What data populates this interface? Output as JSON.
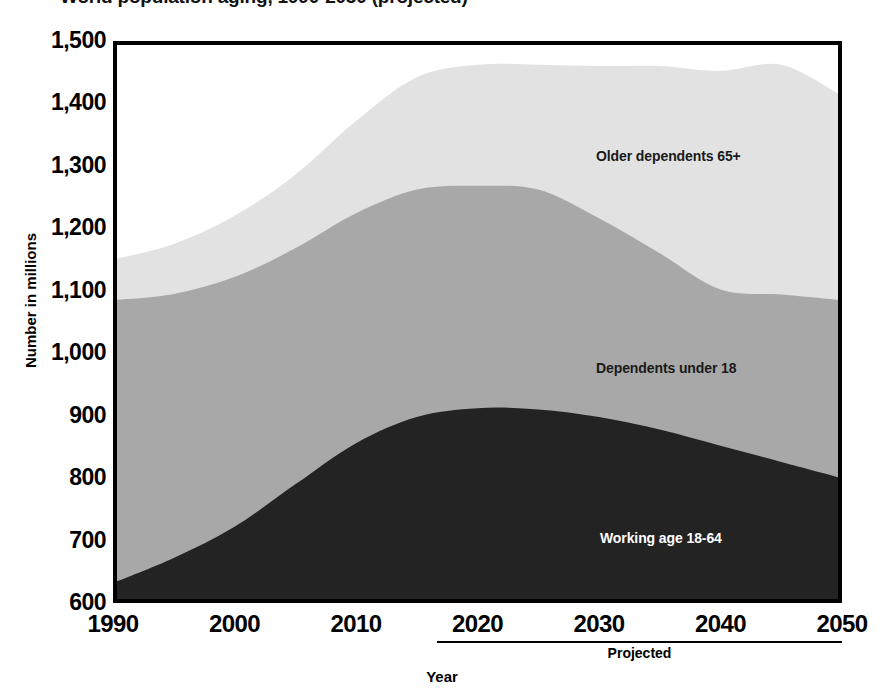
{
  "chart_data": {
    "type": "area",
    "stacked": true,
    "title": "World population aging, 1990-2050 (projected)",
    "xlabel": "Year",
    "ylabel": "Number in millions",
    "xlim": [
      1990,
      2050
    ],
    "ylim": [
      600,
      1500
    ],
    "grid": false,
    "legend_position": "inline-on-bands",
    "x_tick_labels": [
      "1990",
      "2000",
      "2010",
      "2020",
      "2030",
      "2040",
      "2050"
    ],
    "x_ticks": [
      1990,
      2000,
      2010,
      2020,
      2030,
      2040,
      2050
    ],
    "y_tick_labels": [
      "1,500",
      "1,400",
      "1,300",
      "1,200",
      "1,100",
      "1,000",
      "900",
      "800",
      "700",
      "600"
    ],
    "y_ticks": [
      1500,
      1400,
      1300,
      1200,
      1100,
      1000,
      900,
      800,
      700,
      600
    ],
    "annotations": [
      {
        "text": "Projected",
        "from_year": 2017,
        "to_year": 2050,
        "position": "below-axis"
      }
    ],
    "x": [
      1990,
      1995,
      2000,
      2005,
      2010,
      2015,
      2020,
      2025,
      2030,
      2035,
      2040,
      2045,
      2050
    ],
    "series": [
      {
        "name": "Working age 18-64",
        "color": "#232323",
        "label_color": "#ffffff",
        "values": [
          632,
          672,
          722,
          790,
          856,
          898,
          912,
          910,
          898,
          878,
          852,
          826,
          800
        ]
      },
      {
        "name": "Dependents under 18",
        "color": "#a8a8a8",
        "label_color": "#1a1a1a",
        "values": [
          453,
          423,
          400,
          378,
          368,
          364,
          356,
          352,
          318,
          282,
          250,
          268,
          285
        ]
      },
      {
        "name": "Older dependents 65+",
        "color": "#e2e2e2",
        "label_color": "#1a1a1a",
        "values": [
          65,
          80,
          98,
          118,
          148,
          180,
          194,
          200,
          244,
          300,
          350,
          368,
          327
        ]
      }
    ],
    "cumulative_tops": {
      "working_age": [
        632,
        672,
        722,
        790,
        856,
        898,
        912,
        910,
        898,
        878,
        852,
        826,
        800
      ],
      "plus_under18": [
        1085,
        1095,
        1122,
        1168,
        1224,
        1262,
        1268,
        1262,
        1216,
        1160,
        1102,
        1094,
        1085
      ],
      "total": [
        1150,
        1175,
        1220,
        1286,
        1372,
        1442,
        1462,
        1462,
        1460,
        1460,
        1452,
        1462,
        1412
      ]
    }
  },
  "axis": {
    "y_title": "Number in millions",
    "x_title": "Year"
  },
  "labels": {
    "older": "Older dependents 65+",
    "under18": "Dependents under 18",
    "working": "Working age 18-64",
    "projected": "Projected"
  },
  "title": "World population aging, 1990-2050 (projected)"
}
